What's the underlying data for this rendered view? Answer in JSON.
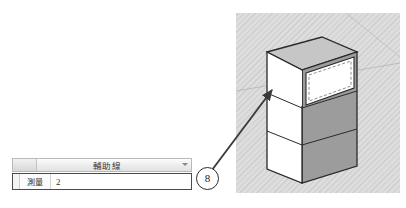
{
  "viewport": {
    "name": "3d-model-viewport",
    "model_description": "tall rectangular cabinet divided into three stacked faces",
    "selected_face": "top",
    "selection_style": "dashed-highlight-rectangle",
    "background_pattern": "diagonal-hatch",
    "colors": {
      "background_hatch": "#d9d9d9",
      "face_front": "#ffffff",
      "face_side": "#9e9e9e",
      "face_top": "#c8c8c8",
      "outline": "#2a2a2a",
      "horizon_line": "#b0b0b0"
    }
  },
  "callout": {
    "badge_label": "8",
    "badge_name": "callout-badge-8",
    "arrow_description": "arrow from badge to selected top face"
  },
  "panel": {
    "header": {
      "title": "輔助線",
      "caret": "chevron-down-icon"
    },
    "row": {
      "label": "測量",
      "value": "2",
      "placeholder": "2"
    }
  }
}
